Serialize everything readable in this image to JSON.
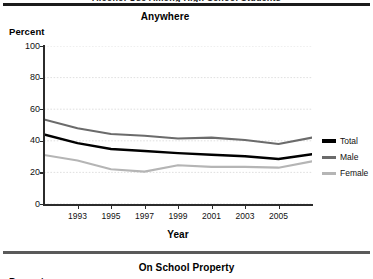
{
  "page": {
    "clipped_header_text": "Alcohol Use Among High School Students",
    "next_section_title": "On School Property",
    "next_section_y_axis_title": "Percent"
  },
  "legend": {
    "items": [
      {
        "label": "Total",
        "color": "#000000"
      },
      {
        "label": "Male",
        "color": "#6b6b6b"
      },
      {
        "label": "Female",
        "color": "#b5b5b5"
      }
    ]
  },
  "chart_data": {
    "type": "line",
    "title": "Anywhere",
    "xlabel": "Year",
    "ylabel": "Percent",
    "ylim": [
      0,
      100
    ],
    "xlim": [
      1991,
      2007
    ],
    "ytick_labels": [
      "0",
      "20",
      "40",
      "60",
      "80",
      "100"
    ],
    "yticks": [
      0,
      20,
      40,
      60,
      80,
      100
    ],
    "xtick_labels": [
      "1993",
      "1995",
      "1997",
      "1999",
      "2001",
      "2003",
      "2005"
    ],
    "xticks": [
      1993,
      1995,
      1997,
      1999,
      2001,
      2003,
      2005
    ],
    "grid": "horizontal",
    "legend_position": "right",
    "x": [
      1991,
      1993,
      1995,
      1997,
      1999,
      2001,
      2003,
      2005,
      2007
    ],
    "series": [
      {
        "name": "Total",
        "color": "#000000",
        "values": [
          44.0,
          38.5,
          34.8,
          33.5,
          32.2,
          31.2,
          30.2,
          28.5,
          31.5
        ]
      },
      {
        "name": "Male",
        "color": "#6b6b6b",
        "values": [
          53.5,
          48.0,
          44.3,
          43.2,
          41.5,
          42.0,
          40.5,
          38.0,
          42.0
        ]
      },
      {
        "name": "Female",
        "color": "#b5b5b5",
        "values": [
          31.0,
          27.5,
          22.0,
          20.5,
          24.5,
          23.5,
          23.5,
          23.0,
          27.0
        ]
      }
    ]
  }
}
